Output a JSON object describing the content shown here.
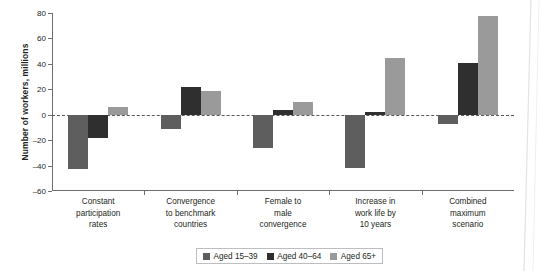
{
  "chart_data": {
    "type": "bar",
    "title": "",
    "subtitle": "",
    "xlabel": "",
    "ylabel": "Number of workers, millions",
    "ylim": [
      -60,
      80
    ],
    "yticks": [
      80,
      60,
      40,
      20,
      0,
      -20,
      -40,
      -60
    ],
    "ytick_labels": [
      "80",
      "60",
      "40",
      "20",
      "0",
      "–20",
      "–40",
      "–60"
    ],
    "grid": false,
    "zero_line": true,
    "legend_position": "bottom-center",
    "categories": [
      "Constant participation rates",
      "Convergence to benchmark countries",
      "Female to male convergence",
      "Increase in work life by 10 years",
      "Combined maximum scenario"
    ],
    "category_lines": [
      [
        "Constant",
        "participation",
        "rates"
      ],
      [
        "Convergence",
        "to benchmark",
        "countries"
      ],
      [
        "Female to",
        "male",
        "convergence"
      ],
      [
        "Increase in",
        "work life by",
        "10 years"
      ],
      [
        "Combined",
        "maximum",
        "scenario"
      ]
    ],
    "series": [
      {
        "name": "Aged 15–39",
        "color": "#5e5e5e",
        "values": [
          -43,
          -11,
          -26,
          -42,
          -7
        ]
      },
      {
        "name": "Aged 40–64",
        "color": "#2f2f2f",
        "values": [
          -18,
          22,
          4,
          2,
          41
        ]
      },
      {
        "name": "Aged 65+",
        "color": "#9a9a9a",
        "values": [
          6,
          19,
          10,
          45,
          78
        ]
      }
    ]
  },
  "legend": {
    "items": [
      {
        "label": "Aged 15–39",
        "color": "#5e5e5e"
      },
      {
        "label": "Aged 40–64",
        "color": "#2f2f2f"
      },
      {
        "label": "Aged 65+",
        "color": "#9a9a9a"
      }
    ]
  },
  "axis": {
    "y_title": "Number of workers, millions"
  },
  "colors": {
    "axis": "#6d6e71",
    "text": "#231f20",
    "zero_line": "#58595b",
    "legend_border": "#bcbec0"
  }
}
